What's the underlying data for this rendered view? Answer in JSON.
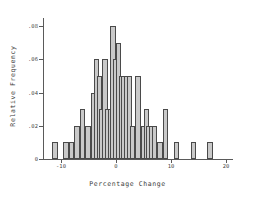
{
  "chart_data": {
    "type": "bar",
    "title": "",
    "subtitle": "",
    "xlabel": "Percentage Change",
    "ylabel": "Relative Frequency",
    "xlim": [
      -13,
      21
    ],
    "ylim": [
      0,
      0.085
    ],
    "grid": false,
    "legend": null,
    "bin_width": 1,
    "x_ticks": [
      -10,
      0,
      10,
      20
    ],
    "x_tick_labels": [
      "-10",
      "0",
      "10",
      "20"
    ],
    "y_ticks": [
      0,
      0.02,
      0.04,
      0.06,
      0.08
    ],
    "y_tick_labels": [
      "0",
      ".02",
      ".04",
      ".06",
      ".08"
    ],
    "bar_fill_color": "#c9c9c9",
    "bar_edge_color": "#4a4a4a",
    "axis_color": "#5a5a5a",
    "categories": [
      "-11",
      "-9",
      "-8",
      "-7",
      "-6",
      "-5",
      "-4",
      "-3.5",
      "-3",
      "-2.5",
      "-2",
      "-1.5",
      "-1",
      "-0.5",
      "0",
      "0.5",
      "1",
      "1.5",
      "2",
      "2.5",
      "3",
      "4",
      "5",
      "5.5",
      "6",
      "6.5",
      "7",
      "8",
      "9",
      "11",
      "14",
      "17"
    ],
    "values": [
      0.01,
      0.01,
      0.01,
      0.02,
      0.03,
      0.02,
      0.04,
      0.06,
      0.05,
      0.03,
      0.06,
      0.03,
      0.03,
      0.08,
      0.06,
      0.07,
      0.05,
      0.05,
      0.05,
      0.05,
      0.02,
      0.05,
      0.02,
      0.03,
      0.02,
      0.02,
      0.02,
      0.01,
      0.03,
      0.01,
      0.01,
      0.01
    ]
  }
}
